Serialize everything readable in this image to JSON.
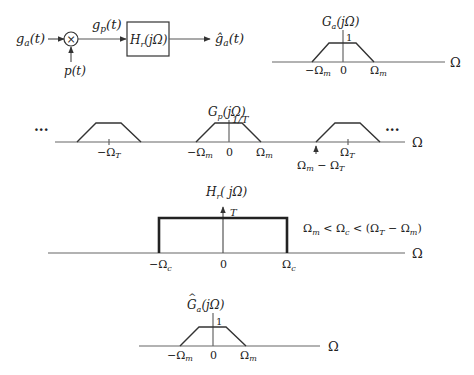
{
  "block_diagram": {
    "input": "g_a(t)",
    "input_main": "g",
    "input_sub": "a",
    "input_arg": "(t)",
    "multiplier": "×",
    "sampling": "p(t)",
    "sampled_main": "g",
    "sampled_sub": "p",
    "sampled_arg": "(t)",
    "filter_main": "H",
    "filter_sub": "r",
    "filter_arg": "(jΩ)",
    "output_main": "ĝ",
    "output_sub": "a",
    "output_arg": "(t)"
  },
  "plot_ga": {
    "title_main": "G",
    "title_sub": "a",
    "title_arg": "(jΩ)",
    "peak": "1",
    "ticks": [
      "−Ω",
      "0",
      "Ω"
    ],
    "tick_sub": "m",
    "axis": "Ω"
  },
  "plot_gp": {
    "title_main": "G",
    "title_sub": "p",
    "title_arg": "(jΩ)",
    "peak": "1/T",
    "ellipsis": "···",
    "neg_omega_t": "−Ω",
    "omega_t": "Ω",
    "t_sub": "T",
    "neg_omega_m": "−Ω",
    "zero": "0",
    "omega_m": "Ω",
    "m_sub": "m",
    "diff_label_a": "Ω",
    "diff_label_b": " − Ω",
    "axis": "Ω"
  },
  "plot_hr": {
    "title_main": "H",
    "title_sub": "r",
    "title_arg": "( jΩ)",
    "peak": "T",
    "neg_c": "−Ω",
    "zero": "0",
    "pos_c": "Ω",
    "c_sub": "c",
    "condition_a": "Ω",
    "condition_b": " < Ω",
    "condition_c": " < (Ω",
    "condition_d": " − Ω",
    "condition_e": ")",
    "axis": "Ω"
  },
  "plot_ga_hat": {
    "title_main": "G",
    "title_hat": "^",
    "title_sub": "a",
    "title_arg": "(jΩ)",
    "peak": "1",
    "ticks": [
      "−Ω",
      "0",
      "Ω"
    ],
    "tick_sub": "m",
    "axis": "Ω"
  }
}
